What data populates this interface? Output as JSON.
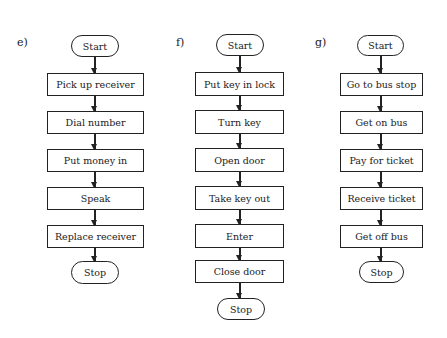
{
  "flowcharts": [
    {
      "label": "e)",
      "start": "Start",
      "steps": [
        "Pick up receiver",
        "Dial number",
        "Put money in",
        "Speak",
        "Replace receiver"
      ],
      "stop": "Stop"
    },
    {
      "label": "f)",
      "start": "Start",
      "steps": [
        "Put key in lock",
        "Turn key",
        "Open door",
        "Take key out",
        "Enter",
        "Close door"
      ],
      "stop": "Stop"
    },
    {
      "label": "g)",
      "start": "Start",
      "steps": [
        "Go to bus stop",
        "Get on bus",
        "Pay for ticket",
        "Receive ticket",
        "Get off bus"
      ],
      "stop": "Stop"
    }
  ]
}
